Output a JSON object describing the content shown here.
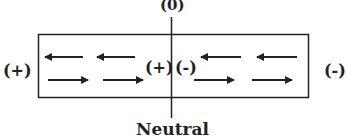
{
  "diagram": {
    "top_label": "(0)",
    "bottom_label": "Neutral",
    "left_outer_label": "(+)",
    "right_outer_label": "(-)",
    "center_left_label": "(+)",
    "center_right_label": "(-)",
    "arrows": {
      "left_half": {
        "top_row": [
          "left",
          "left"
        ],
        "bottom_row": [
          "right",
          "right"
        ]
      },
      "right_half": {
        "top_row": [
          "left",
          "left"
        ],
        "bottom_row": [
          "right",
          "right"
        ]
      }
    },
    "colors": {
      "stroke": "#222222",
      "background": "#ffffff"
    }
  }
}
